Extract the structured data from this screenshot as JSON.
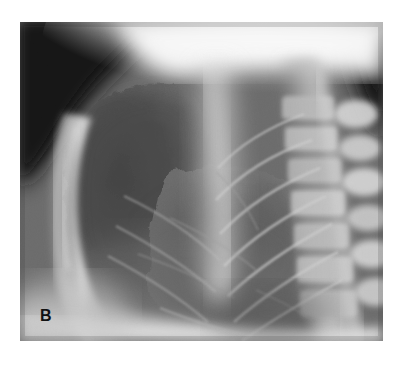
{
  "figure": {
    "panel_label": "B",
    "modality": "chest-radiograph",
    "projection": "lateral",
    "caption_text": "",
    "plate": {
      "left": 20,
      "top": 22,
      "width": 363,
      "height": 319
    },
    "page_background": "#ffffff"
  },
  "palette": {
    "page_white": "#ffffff",
    "air_black": "#171717",
    "corner_dark": "#1d1d1d",
    "lung_dark": "#4a4a4a",
    "lung_mid": "#626262",
    "soft_tissue": "#8f8f8f",
    "bone_light": "#c9c9c9",
    "bone_bright": "#e6e6e6",
    "shoulder_white": "#f7f7f7",
    "label_black": "#111111"
  },
  "anatomy": {
    "regions": [
      {
        "name": "upper-mediastinum-shoulder",
        "description": "broad bright band across the superior third",
        "tone": "#f5f5f5"
      },
      {
        "name": "retrosternal-lung-field",
        "description": "dark lucent lung anterior to the heart, upper left",
        "tone": "#4d4d4d"
      },
      {
        "name": "anterior-chest-wall-sternum",
        "description": "bright curved band along the anterior (left) margin",
        "tone": "#d2d2d2"
      },
      {
        "name": "retrocardiac-lung-field",
        "description": "mid-gray lung posterior and inferior to the heart",
        "tone": "#6a6a6a"
      },
      {
        "name": "thoracic-spine",
        "description": "vertical column of vertebral bodies, right of center",
        "tone": "#c4c4c4"
      },
      {
        "name": "posterior-ribs",
        "description": "thin bright oblique lines crossing the posterior lung",
        "tone": "#b5b5b5"
      },
      {
        "name": "hemidiaphragm",
        "description": "bright band along the inferior margin",
        "tone": "#cfcfcf"
      },
      {
        "name": "pre-tracheal-air-upper-left",
        "description": "very dark corner above the lung apex",
        "tone": "#181818"
      },
      {
        "name": "posterior-neck-air-upper-right",
        "description": "dark wedge at the superior right corner",
        "tone": "#1f1f1f"
      }
    ]
  }
}
